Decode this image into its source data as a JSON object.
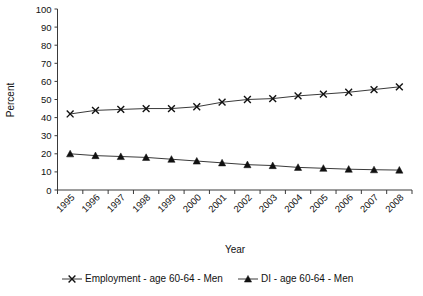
{
  "chart_data": {
    "type": "line",
    "title": "",
    "xlabel": "Year",
    "ylabel": "Percent",
    "grid": false,
    "legend_position": "bottom",
    "ylim": [
      0,
      100
    ],
    "ytick_step": 10,
    "yticks": [
      "0",
      "10",
      "20",
      "30",
      "40",
      "50",
      "60",
      "70",
      "80",
      "90",
      "100"
    ],
    "categories": [
      "1995",
      "1996",
      "1997",
      "1998",
      "1999",
      "2000",
      "2001",
      "2002",
      "2003",
      "2004",
      "2005",
      "2006",
      "2007",
      "2008"
    ],
    "series": [
      {
        "name": "Employment - age 60-64 - Men",
        "marker": "x",
        "values": [
          42,
          44,
          44.5,
          45,
          45,
          46,
          48.5,
          50,
          50.5,
          52,
          53,
          54,
          55.5,
          57
        ]
      },
      {
        "name": "DI - age 60-64 - Men",
        "marker": "triangle",
        "values": [
          20,
          19,
          18.5,
          18,
          17,
          16,
          15,
          14,
          13.5,
          12.5,
          12,
          11.5,
          11.2,
          11
        ]
      }
    ]
  },
  "legend": {
    "items": [
      {
        "label": "Employment - age 60-64 - Men",
        "marker": "x-marker"
      },
      {
        "label": "DI - age 60-64 - Men",
        "marker": "triangle-marker"
      }
    ]
  },
  "colors": {
    "line": "#3a3a3a",
    "marker": "#111111",
    "background": "#ffffff",
    "text": "#111111"
  }
}
